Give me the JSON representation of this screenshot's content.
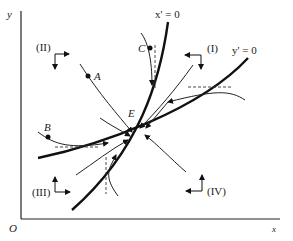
{
  "diagram": {
    "type": "phase-diagram",
    "axes": {
      "x_label": "x",
      "y_label": "y",
      "origin_label": "O"
    },
    "nullclines": [
      {
        "id": "x-nullcline",
        "label": "x' = 0"
      },
      {
        "id": "y-nullcline",
        "label": "y' = 0"
      }
    ],
    "equilibrium": {
      "label": "E"
    },
    "points": [
      {
        "id": "A",
        "label": "A"
      },
      {
        "id": "B",
        "label": "B"
      },
      {
        "id": "C",
        "label": "C"
      }
    ],
    "regions": [
      {
        "id": "I",
        "label": "(I)"
      },
      {
        "id": "II",
        "label": "(II)"
      },
      {
        "id": "III",
        "label": "(III)"
      },
      {
        "id": "IV",
        "label": "(IV)"
      }
    ],
    "colors": {
      "ink": "#111111",
      "background": "#ffffff"
    }
  }
}
